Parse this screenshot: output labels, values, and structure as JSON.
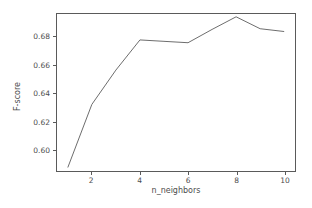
{
  "chart_data": {
    "type": "line",
    "title": "",
    "xlabel": "n_neighbors",
    "ylabel": "F-score",
    "x": [
      1,
      2,
      3,
      4,
      5,
      6,
      7,
      8,
      9,
      10
    ],
    "values": [
      0.587,
      0.632,
      0.6565,
      0.678,
      0.677,
      0.676,
      0.6855,
      0.6945,
      0.686,
      0.684
    ],
    "series": [
      {
        "name": "F-score",
        "values": [
          0.587,
          0.632,
          0.6565,
          0.678,
          0.677,
          0.676,
          0.6855,
          0.6945,
          0.686,
          0.684
        ]
      }
    ],
    "xlim": [
      0.55,
      10.45
    ],
    "ylim": [
      0.5845,
      0.6965
    ],
    "xticks": [
      2,
      4,
      6,
      8,
      10
    ],
    "yticks": [
      0.6,
      0.62,
      0.64,
      0.66,
      0.68
    ],
    "xtick_labels": [
      "2",
      "4",
      "6",
      "8",
      "10"
    ],
    "ytick_labels": [
      "0.60",
      "0.62",
      "0.64",
      "0.66",
      "0.68"
    ],
    "grid": false,
    "legend": null,
    "line_color": "#6b6b6b",
    "line_width": 1,
    "axis_color": "#5a5a5a",
    "background": "#ffffff",
    "text_color": "#4d4d4d"
  }
}
